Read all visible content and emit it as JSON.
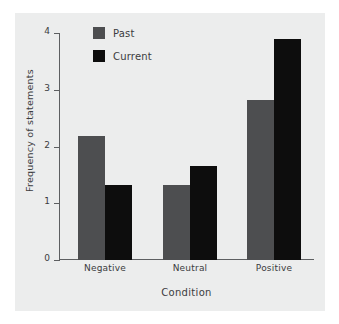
{
  "chart_data": {
    "type": "bar",
    "title": "",
    "subtitle": "",
    "categories": [
      "Negative",
      "Neutral",
      "Positive"
    ],
    "series": [
      {
        "name": "Past",
        "color": "#4d4e50",
        "values": [
          2.18,
          1.33,
          2.82
        ]
      },
      {
        "name": "Current",
        "color": "#0d0d0d",
        "values": [
          1.33,
          1.66,
          3.9
        ]
      }
    ],
    "xlabel": "Condition",
    "ylabel": "Frequency of statements",
    "ylim": [
      0,
      4
    ],
    "yticks": [
      0,
      1,
      2,
      3,
      4
    ],
    "ytick_labels": [
      "0",
      "1",
      "2",
      "3",
      "4"
    ],
    "grid": false,
    "legend_position": "top-left",
    "legend_entries": [
      "Past",
      "Current"
    ],
    "annotations": []
  },
  "legend": {
    "items": [
      {
        "label": "Past",
        "swatch": "past-swatch"
      },
      {
        "label": "Current",
        "swatch": "current-swatch"
      }
    ]
  },
  "colors": {
    "past": "#4d4e50",
    "current": "#0d0d0d",
    "panel_background": "#eceded",
    "axis": "#5d5f61",
    "text": "#3b3c3e"
  }
}
